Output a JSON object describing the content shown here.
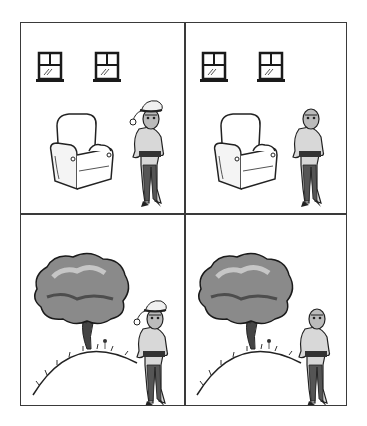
{
  "comic": {
    "layout": "2x2",
    "panels": [
      {
        "position": "top-left",
        "scene": "room",
        "objects": [
          "window",
          "window",
          "armchair",
          "boy"
        ],
        "boy_hat": "santa-hat"
      },
      {
        "position": "top-right",
        "scene": "room",
        "objects": [
          "window",
          "window",
          "armchair",
          "boy"
        ],
        "boy_hat": "none"
      },
      {
        "position": "bottom-left",
        "scene": "hill",
        "objects": [
          "tree",
          "flower",
          "hill",
          "boy"
        ],
        "boy_hat": "santa-hat"
      },
      {
        "position": "bottom-right",
        "scene": "hill",
        "objects": [
          "tree",
          "flower",
          "hill",
          "boy"
        ],
        "boy_hat": "none"
      }
    ],
    "colors": {
      "border": "#3a3a3a",
      "ink": "#222222",
      "background": "#ffffff"
    }
  }
}
